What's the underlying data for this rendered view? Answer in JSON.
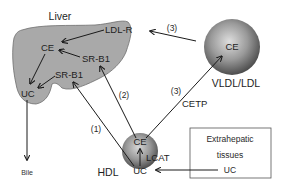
{
  "colors": {
    "liver_fill": "#a9a9a9",
    "liver_stroke": "#6f6f6f",
    "sphere_light": "#d9d9d9",
    "sphere_dark": "#4a4a4a",
    "arrow": "#1a1a1a",
    "box_stroke": "#555555"
  },
  "liver": {
    "label": "Liver",
    "receptor_ldlr": "LDL-R",
    "receptor_srb1_upper": "SR-B1",
    "receptor_srb1_lower": "SR-B1",
    "ce": "CE",
    "uc": "UC"
  },
  "vldl": {
    "label": "VLDL/LDL",
    "ce": "CE"
  },
  "hdl": {
    "label": "HDL",
    "ce": "CE",
    "uc": "UC",
    "enzyme": "LCAT"
  },
  "extrahepatic": {
    "line1": "Extrahepatic",
    "line2": "tissues",
    "uc": "UC"
  },
  "pathways": {
    "p1": "(1)",
    "p2": "(2)",
    "p3_upper": "(3)",
    "p3_lower": "(3)",
    "cetp": "CETP"
  },
  "bile": "Bile"
}
